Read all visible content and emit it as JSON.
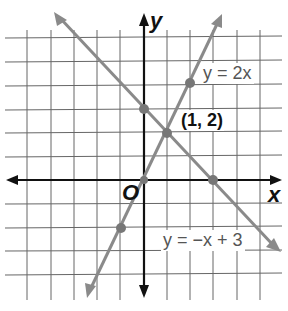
{
  "graph": {
    "axes": {
      "x_label": "x",
      "y_label": "y",
      "origin_label": "O"
    },
    "lines": [
      {
        "name": "y = 2x",
        "label": "y = 2x",
        "slope": 2,
        "intercept": 0
      },
      {
        "name": "y = -x + 3",
        "label": "y = −x + 3",
        "slope": -1,
        "intercept": 3
      }
    ],
    "intersection": {
      "label": "(1, 2)",
      "x": 1,
      "y": 2
    },
    "points": [
      [
        0,
        3
      ],
      [
        1,
        2
      ],
      [
        3,
        0
      ],
      [
        2,
        4
      ],
      [
        0,
        0
      ],
      [
        -1,
        -2
      ]
    ],
    "grid": {
      "xmin": -5,
      "xmax": 5,
      "ymin": -5,
      "ymax": 6
    },
    "colors": {
      "grid": "#555555",
      "axis": "#111111",
      "line": "#8a8a8a",
      "point": "#777777"
    }
  }
}
